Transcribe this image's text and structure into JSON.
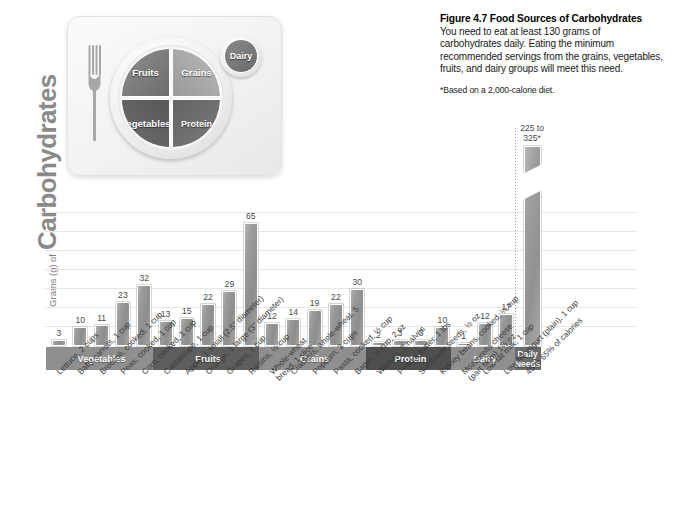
{
  "caption": {
    "title": "Figure 4.7  Food Sources of Carbohydrates",
    "body": "You need to eat at least 130 grams of carbohydrates daily. Eating the minimum recommended servings from the grains, vegetables, fruits, and dairy groups will meet this need.",
    "note": "*Based on a 2,000-calorie diet."
  },
  "myplate": {
    "fruits": "Fruits",
    "grains": "Grains",
    "vegetables": "Vegetables",
    "protein": "Protein",
    "dairy": "Dairy"
  },
  "yaxis": {
    "small": "Grams (g) of",
    "big": "Carbohydrates"
  },
  "chart_data": {
    "type": "bar",
    "title": "Figure 4.7  Food Sources of Carbohydrates",
    "xlabel": "",
    "ylabel": "Grams (g) of Carbohydrates",
    "ylim": [
      0,
      70
    ],
    "grid": true,
    "legend": "none",
    "gridline_step": 10,
    "categories": [
      "Lettuce, 2 cups",
      "Baby carrots, 1 cup",
      "Broccoli, cooked, 1 cup",
      "Peas, cooked, 1 cup",
      "Corn, cooked, 1 cup",
      "Cantaloupe, 1 cup",
      "Apple, 1 small (2.5\" diameter)",
      "Orange, 1 large (3\" diameter)",
      "Grapes, 1 cup",
      "Raisins, ½ cup",
      "Whole-wheat bread, 1 slice",
      "Crackers, whole-wheat, 5",
      "Popcorn, 3 cups",
      "Pasta, cooked, ½ cup",
      "Bagel, ½ cup, 2 oz",
      "Walnuts, 7 halves",
      "Peanut butter, 1 tbs",
      "Sunflower seeds, ½ oz",
      "Kidney beans, cooked, ¼ cup",
      "Mozzarella cheese (part skim) 1½ oz",
      "Low-fat milk, 1 cup",
      "Low-fat yogurt (plain), 1 cup",
      "45 to 65% of calories"
    ],
    "values": [
      3,
      10,
      11,
      23,
      32,
      13,
      15,
      22,
      29,
      65,
      12,
      14,
      19,
      22,
      30,
      2,
      3,
      3,
      10,
      1,
      12,
      17,
      null
    ],
    "value_labels": [
      "3",
      "10",
      "11",
      "23",
      "32",
      "13",
      "15",
      "22",
      "29",
      "65",
      "12",
      "14",
      "19",
      "22",
      "30",
      "2",
      "3",
      "3",
      "10",
      "1",
      "12",
      "17",
      "225 to\n325*"
    ],
    "daily_needs": {
      "label": "225 to 325*",
      "line1": "225 to",
      "line2": "325*",
      "range": [
        225,
        325
      ],
      "has_axis_break": true
    },
    "groups": [
      {
        "name": "Vegetables",
        "start": 0,
        "count": 5,
        "color": "#8f8f8f"
      },
      {
        "name": "Fruits",
        "start": 5,
        "count": 5,
        "color": "#5e5e5e"
      },
      {
        "name": "Grains",
        "start": 10,
        "count": 5,
        "color": "#8f8f8f"
      },
      {
        "name": "Protein",
        "start": 15,
        "count": 4,
        "color": "#4f4f4f"
      },
      {
        "name": "Dairy",
        "start": 19,
        "count": 3,
        "color": "#8f8f8f"
      },
      {
        "name": "Daily Needs",
        "start": 22,
        "count": 1,
        "color": "#6b6b6b"
      }
    ]
  },
  "colors": {
    "bar_fill": "#9c9c9c",
    "gridline": "#e6e6e6",
    "band_light": "#8f8f8f",
    "band_dark": "#5e5e5e",
    "text": "#3a3a3a"
  }
}
